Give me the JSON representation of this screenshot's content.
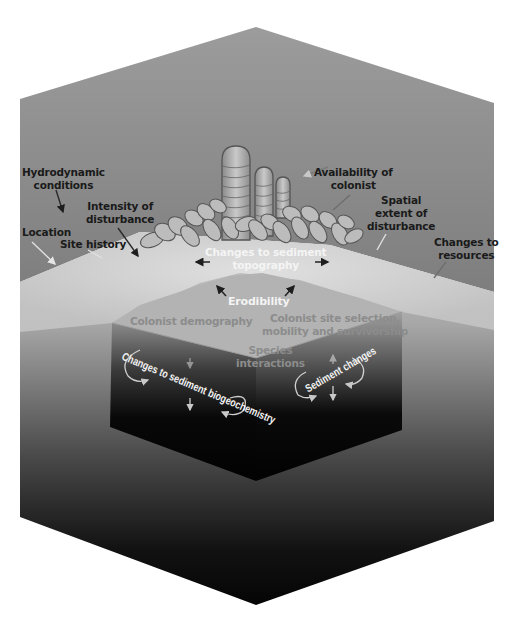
{
  "diagram": {
    "type": "conceptual-block-diagram",
    "colors": {
      "water_top": "#9a9a9a",
      "water_bottom": "#7c7c7c",
      "sediment_surface": "#d6d6d6",
      "block_top": "#b4b4b4",
      "block_dark": "#050505",
      "outer_sediment_top": "#a8a8a8",
      "outer_sediment_bottom": "#0a0a0a",
      "organism_fill": "#bdbdbd",
      "organism_outline": "#5a5a5a",
      "label_dark": "#1a1a1a",
      "label_light": "#f4f4f4",
      "label_grey": "#8c8c8c"
    },
    "external_labels": {
      "hydrodynamic": [
        "Hydrodynamic",
        "conditions"
      ],
      "intensity": [
        "Intensity of",
        "disturbance"
      ],
      "location": "Location",
      "site_history": "Site history",
      "availability": [
        "Availability of",
        "colonist"
      ],
      "spatial": [
        "Spatial",
        "extent of",
        "disturbance"
      ],
      "resources": [
        "Changes to",
        "resources"
      ]
    },
    "surface_labels": {
      "topography": [
        "Changes to sediment",
        "topography"
      ],
      "erodibility": "Erodibility"
    },
    "block_labels": {
      "demography": "Colonist demography",
      "site_selection": [
        "Colonist site selection,",
        "mobility and survivorship"
      ],
      "species": [
        "Species",
        "interactions"
      ],
      "biogeochemistry": "Changes to sediment biogeochemistry",
      "sediment_changes": "Sediment changes"
    }
  }
}
